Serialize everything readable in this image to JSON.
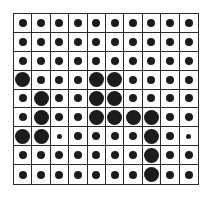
{
  "grid": {
    "rows": 9,
    "cols": 10,
    "dot_color": "#1c1c1c",
    "line_color": "#2a2a2a",
    "legend": {
      "n": "normal dot",
      "L": "large dot",
      "s": "small dot"
    },
    "cells": [
      [
        "n",
        "n",
        "n",
        "n",
        "n",
        "n",
        "n",
        "n",
        "n",
        "n"
      ],
      [
        "n",
        "n",
        "n",
        "n",
        "n",
        "n",
        "n",
        "n",
        "n",
        "n"
      ],
      [
        "n",
        "n",
        "n",
        "n",
        "n",
        "n",
        "n",
        "n",
        "n",
        "n"
      ],
      [
        "L",
        "n",
        "n",
        "n",
        "L",
        "L",
        "n",
        "n",
        "n",
        "n"
      ],
      [
        "n",
        "L",
        "n",
        "n",
        "L",
        "L",
        "n",
        "n",
        "n",
        "n"
      ],
      [
        "n",
        "L",
        "n",
        "n",
        "L",
        "L",
        "L",
        "L",
        "n",
        "n"
      ],
      [
        "L",
        "L",
        "s",
        "n",
        "n",
        "n",
        "n",
        "L",
        "n",
        "s"
      ],
      [
        "n",
        "n",
        "n",
        "n",
        "n",
        "n",
        "n",
        "L",
        "n",
        "n"
      ],
      [
        "n",
        "n",
        "n",
        "n",
        "n",
        "n",
        "n",
        "L",
        "n",
        "n"
      ]
    ]
  }
}
